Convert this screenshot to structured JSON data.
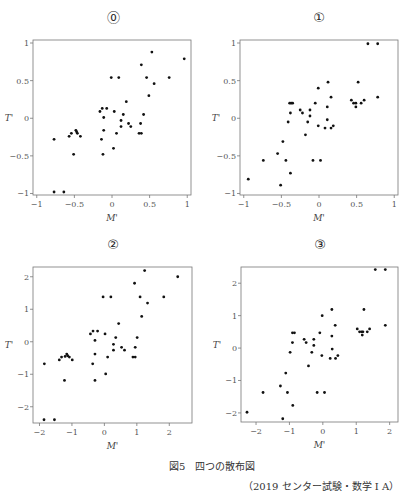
{
  "figure": {
    "caption": "図5　四つの散布図",
    "source": "（2019 センター試験・数学 I A）"
  },
  "chart_data": [
    {
      "type": "scatter",
      "panel_label": "⓪",
      "title": "",
      "xlabel": "M'",
      "ylabel": "T'",
      "xlim": [
        -1.05,
        1.05
      ],
      "ylim": [
        -1.02,
        1.04
      ],
      "xticks": [
        -1,
        -0.5,
        0,
        0.5,
        1
      ],
      "xtick_labels": [
        "−1",
        "−0.5",
        "0",
        "0.5",
        "1"
      ],
      "yticks": [
        -1,
        -0.5,
        0,
        0.5,
        1
      ],
      "ytick_labels": [
        "−1",
        "−0.5",
        "0",
        "0.5",
        "1"
      ],
      "grid": false,
      "points": [
        [
          0.53,
          0.88
        ],
        [
          0.96,
          0.79
        ],
        [
          0.39,
          0.71
        ],
        [
          -0.01,
          0.54
        ],
        [
          0.09,
          0.54
        ],
        [
          0.46,
          0.54
        ],
        [
          0.76,
          0.54
        ],
        [
          0.56,
          0.46
        ],
        [
          0.49,
          0.3
        ],
        [
          0.19,
          0.22
        ],
        [
          -0.13,
          0.13
        ],
        [
          -0.07,
          0.13
        ],
        [
          -0.16,
          0.09
        ],
        [
          0.03,
          0.09
        ],
        [
          0.15,
          0.05
        ],
        [
          0.42,
          0.05
        ],
        [
          -0.11,
          0.01
        ],
        [
          0.12,
          -0.03
        ],
        [
          0.22,
          -0.07
        ],
        [
          0.38,
          -0.07
        ],
        [
          0.25,
          -0.11
        ],
        [
          0.12,
          -0.11
        ],
        [
          -0.11,
          -0.16
        ],
        [
          -0.48,
          -0.16
        ],
        [
          -0.47,
          -0.18
        ],
        [
          -0.54,
          -0.2
        ],
        [
          -0.46,
          -0.2
        ],
        [
          0.06,
          -0.2
        ],
        [
          0.36,
          -0.2
        ],
        [
          0.39,
          -0.2
        ],
        [
          -0.57,
          -0.24
        ],
        [
          -0.42,
          -0.24
        ],
        [
          -0.14,
          -0.28
        ],
        [
          -0.77,
          -0.28
        ],
        [
          0.02,
          -0.4
        ],
        [
          -0.51,
          -0.48
        ],
        [
          -0.12,
          -0.48
        ],
        [
          -0.77,
          -0.98
        ],
        [
          -0.64,
          -0.98
        ]
      ]
    },
    {
      "type": "scatter",
      "panel_label": "①",
      "title": "",
      "xlabel": "M'",
      "ylabel": "T'",
      "xlim": [
        -1.05,
        1.05
      ],
      "ylim": [
        -1.02,
        1.04
      ],
      "xticks": [
        -1,
        -0.5,
        0,
        0.5,
        1
      ],
      "xtick_labels": [
        "−1",
        "−0.5",
        "0",
        "0.5",
        "1"
      ],
      "yticks": [
        -1,
        -0.5,
        0,
        0.5,
        1
      ],
      "ytick_labels": [
        "−1",
        "−0.5",
        "0",
        "0.5",
        "1"
      ],
      "grid": false,
      "points": [
        [
          0.65,
          0.99
        ],
        [
          0.78,
          0.99
        ],
        [
          0.12,
          0.48
        ],
        [
          0.52,
          0.48
        ],
        [
          -0.01,
          0.4
        ],
        [
          0.16,
          0.28
        ],
        [
          0.78,
          0.28
        ],
        [
          0.43,
          0.24
        ],
        [
          0.6,
          0.24
        ],
        [
          -0.39,
          0.2
        ],
        [
          -0.37,
          0.2
        ],
        [
          -0.35,
          0.2
        ],
        [
          -0.05,
          0.2
        ],
        [
          0.46,
          0.2
        ],
        [
          0.49,
          0.2
        ],
        [
          0.56,
          0.2
        ],
        [
          0.11,
          0.15
        ],
        [
          0.49,
          0.15
        ],
        [
          -0.25,
          0.11
        ],
        [
          -0.12,
          0.11
        ],
        [
          -0.22,
          0.07
        ],
        [
          -0.38,
          0.07
        ],
        [
          -0.12,
          0.03
        ],
        [
          0.11,
          -0.02
        ],
        [
          -0.41,
          -0.05
        ],
        [
          -0.15,
          -0.05
        ],
        [
          -0.01,
          -0.1
        ],
        [
          0.19,
          -0.1
        ],
        [
          0.08,
          -0.13
        ],
        [
          0.16,
          -0.13
        ],
        [
          -0.18,
          -0.22
        ],
        [
          -0.48,
          -0.31
        ],
        [
          -0.55,
          -0.47
        ],
        [
          -0.74,
          -0.56
        ],
        [
          -0.44,
          -0.56
        ],
        [
          -0.08,
          -0.56
        ],
        [
          0.02,
          -0.56
        ],
        [
          -0.38,
          -0.73
        ],
        [
          -0.94,
          -0.81
        ],
        [
          -0.51,
          -0.89
        ]
      ]
    },
    {
      "type": "scatter",
      "panel_label": "②",
      "title": "",
      "xlabel": "M'",
      "ylabel": "T'",
      "xlim": [
        -2.2,
        2.7
      ],
      "ylim": [
        -2.5,
        2.3
      ],
      "xticks": [
        -2,
        -1,
        0,
        1,
        2
      ],
      "xtick_labels": [
        "−2",
        "−1",
        "0",
        "1",
        "2"
      ],
      "yticks": [
        -2,
        -1,
        0,
        1,
        2
      ],
      "ytick_labels": [
        "−2",
        "−1",
        "0",
        "1",
        "2"
      ],
      "grid": false,
      "points": [
        [
          1.24,
          2.19
        ],
        [
          2.26,
          2.0
        ],
        [
          0.93,
          1.8
        ],
        [
          -0.04,
          1.38
        ],
        [
          0.2,
          1.38
        ],
        [
          1.1,
          1.38
        ],
        [
          1.83,
          1.38
        ],
        [
          1.33,
          1.19
        ],
        [
          1.15,
          0.78
        ],
        [
          0.44,
          0.56
        ],
        [
          -0.35,
          0.33
        ],
        [
          -0.21,
          0.33
        ],
        [
          -0.43,
          0.24
        ],
        [
          0.02,
          0.24
        ],
        [
          0.35,
          0.13
        ],
        [
          1.01,
          0.13
        ],
        [
          -0.29,
          0.04
        ],
        [
          0.28,
          -0.08
        ],
        [
          0.53,
          -0.17
        ],
        [
          0.95,
          -0.17
        ],
        [
          0.28,
          -0.26
        ],
        [
          0.62,
          -0.26
        ],
        [
          -0.29,
          -0.38
        ],
        [
          -1.16,
          -0.38
        ],
        [
          -1.13,
          -0.43
        ],
        [
          -1.32,
          -0.47
        ],
        [
          -1.08,
          -0.47
        ],
        [
          -1.21,
          -0.45
        ],
        [
          0.1,
          -0.47
        ],
        [
          0.88,
          -0.47
        ],
        [
          0.95,
          -0.47
        ],
        [
          -1.39,
          -0.56
        ],
        [
          -0.99,
          -0.56
        ],
        [
          -1.85,
          -0.68
        ],
        [
          -0.36,
          -0.68
        ],
        [
          0.04,
          -0.99
        ],
        [
          -1.23,
          -1.19
        ],
        [
          -0.29,
          -1.19
        ],
        [
          -1.86,
          -2.4
        ],
        [
          -1.54,
          -2.4
        ]
      ]
    },
    {
      "type": "scatter",
      "panel_label": "③",
      "title": "",
      "xlabel": "M'",
      "ylabel": "T'",
      "xlim": [
        -2.45,
        2.25
      ],
      "ylim": [
        -2.28,
        2.5
      ],
      "xticks": [
        -2,
        -1,
        0,
        1,
        2
      ],
      "xtick_labels": [
        "−2",
        "−1",
        "0",
        "1",
        "2"
      ],
      "yticks": [
        -2,
        -1,
        0,
        1,
        2
      ],
      "ytick_labels": [
        "−2",
        "−1",
        "0",
        "1",
        "2"
      ],
      "grid": false,
      "points": [
        [
          1.57,
          2.42
        ],
        [
          1.87,
          2.42
        ],
        [
          0.27,
          1.19
        ],
        [
          1.23,
          1.19
        ],
        [
          -0.02,
          1.0
        ],
        [
          0.37,
          0.7
        ],
        [
          1.87,
          0.7
        ],
        [
          1.03,
          0.59
        ],
        [
          1.4,
          0.59
        ],
        [
          1.1,
          0.5
        ],
        [
          1.16,
          0.5
        ],
        [
          1.2,
          0.5
        ],
        [
          1.33,
          0.5
        ],
        [
          -0.91,
          0.47
        ],
        [
          -0.85,
          0.47
        ],
        [
          -0.09,
          0.47
        ],
        [
          1.18,
          0.4
        ],
        [
          0.27,
          0.37
        ],
        [
          -0.56,
          0.27
        ],
        [
          -0.27,
          0.27
        ],
        [
          -0.5,
          0.17
        ],
        [
          -0.91,
          0.17
        ],
        [
          -0.27,
          0.08
        ],
        [
          0.28,
          -0.03
        ],
        [
          -0.98,
          -0.13
        ],
        [
          -0.33,
          -0.13
        ],
        [
          -0.03,
          -0.23
        ],
        [
          0.45,
          -0.23
        ],
        [
          0.22,
          -0.32
        ],
        [
          0.38,
          -0.32
        ],
        [
          -0.43,
          -0.55
        ],
        [
          -1.11,
          -0.77
        ],
        [
          -1.27,
          -1.17
        ],
        [
          -1.79,
          -1.37
        ],
        [
          -1.06,
          -1.37
        ],
        [
          -0.17,
          -1.37
        ],
        [
          0.05,
          -1.37
        ],
        [
          -0.9,
          -1.77
        ],
        [
          -2.27,
          -1.98
        ],
        [
          -1.2,
          -2.18
        ]
      ]
    }
  ]
}
